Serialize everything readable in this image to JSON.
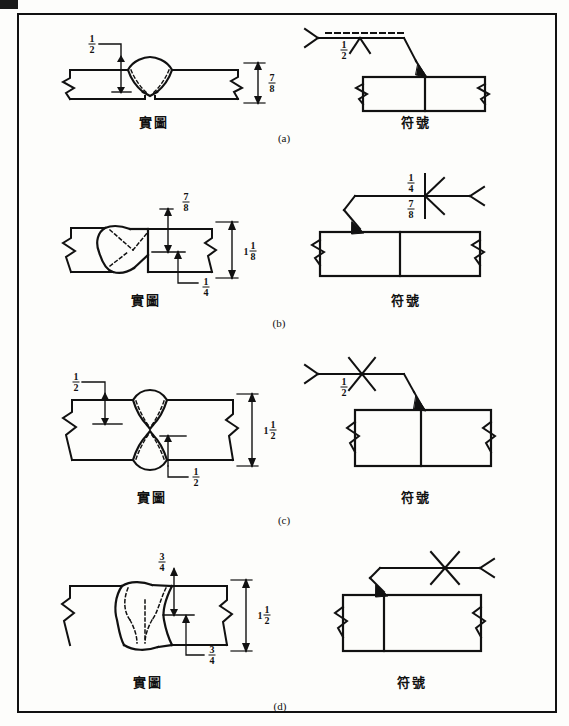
{
  "document": {
    "type": "welding-symbol-figure",
    "border_color": "#111111",
    "background_color": "#fdfdfb",
    "line_color": "#111111"
  },
  "labels": {
    "actual": "實圖",
    "symbol": "符號"
  },
  "figures": [
    {
      "id": "a",
      "caption": "(a)",
      "joint_type": "single-V-groove",
      "actual_label": "實圖",
      "symbol_label": "符號",
      "dimensions": {
        "groove_depth": {
          "numerator": "1",
          "denominator": "2"
        },
        "plate_thickness": {
          "numerator": "7",
          "denominator": "8"
        }
      },
      "symbol": {
        "groove_depth": {
          "numerator": "1",
          "denominator": "2"
        },
        "has_dashed_identification_line": true,
        "has_tail_fork": true,
        "weld_side": "other-side"
      }
    },
    {
      "id": "b",
      "caption": "(b)",
      "joint_type": "double-bevel-groove",
      "actual_label": "實圖",
      "symbol_label": "符號",
      "dimensions": {
        "upper_depth": {
          "numerator": "7",
          "denominator": "8"
        },
        "lower_depth": {
          "numerator": "1",
          "denominator": "4"
        },
        "plate_thickness": {
          "whole": "1",
          "numerator": "1",
          "denominator": "8"
        }
      },
      "symbol": {
        "above_reference": {
          "numerator": "1",
          "denominator": "4"
        },
        "below_reference": {
          "numerator": "7",
          "denominator": "8"
        },
        "has_tail_fork": true,
        "weld_side": "both-sides"
      }
    },
    {
      "id": "c",
      "caption": "(c)",
      "joint_type": "double-V-groove",
      "actual_label": "實圖",
      "symbol_label": "符號",
      "dimensions": {
        "upper_depth": {
          "numerator": "1",
          "denominator": "2"
        },
        "lower_depth": {
          "numerator": "1",
          "denominator": "2"
        },
        "plate_thickness": {
          "whole": "1",
          "numerator": "1",
          "denominator": "2"
        }
      },
      "symbol": {
        "below_reference": {
          "numerator": "1",
          "denominator": "2"
        },
        "has_tail_fork": true,
        "weld_side": "both-sides"
      }
    },
    {
      "id": "d",
      "caption": "(d)",
      "joint_type": "double-bevel-groove-full-penetration",
      "actual_label": "實圖",
      "symbol_label": "符號",
      "dimensions": {
        "upper_depth": {
          "numerator": "3",
          "denominator": "4"
        },
        "lower_depth": {
          "numerator": "3",
          "denominator": "4"
        },
        "plate_thickness": {
          "whole": "1",
          "numerator": "1",
          "denominator": "2"
        }
      },
      "symbol": {
        "has_tail_fork": true,
        "weld_side": "both-sides",
        "dimensions_shown": false
      }
    }
  ]
}
